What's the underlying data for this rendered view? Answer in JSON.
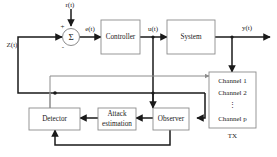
{
  "diagram": {
    "type": "control-system-block-diagram",
    "blocks": [
      {
        "id": "controller",
        "label": "Controller"
      },
      {
        "id": "system",
        "label": "System"
      },
      {
        "id": "detector",
        "label": "Detector"
      },
      {
        "id": "attack_estimation",
        "label_line1": "Attack",
        "label_line2": "estimation"
      },
      {
        "id": "observer",
        "label": "Observer"
      },
      {
        "id": "tx",
        "label": "TX"
      }
    ],
    "summing_junction": {
      "symbol": "Σ",
      "plus_sign": "+",
      "minus_sign": "-"
    },
    "signals": {
      "reference": "r(t)",
      "error": "e(t)",
      "control": "u(t)",
      "output": "y(t)",
      "feedback": "Z(t)"
    },
    "channels": {
      "items": [
        "Channel 1",
        "Channel 2",
        "Channel p"
      ],
      "ellipsis": "⋮",
      "caption": "TX"
    },
    "colors": {
      "wire_dark": "#1a1a1a",
      "wire_gray": "#8c8c8c",
      "box_stroke": "#8c8c8c",
      "box_fill": "#ffffff",
      "background": "#ffffff"
    }
  }
}
